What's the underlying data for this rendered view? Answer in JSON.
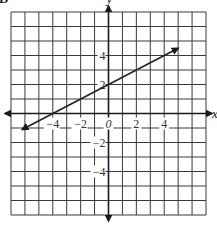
{
  "figure": {
    "corner_label": "B",
    "x_axis_letter": "x",
    "y_axis_letter": "y"
  },
  "chart_data": {
    "type": "line",
    "title": "",
    "xlabel": "x",
    "ylabel": "y",
    "xlim": [
      -7,
      7
    ],
    "ylim": [
      -7,
      7
    ],
    "grid": true,
    "grid_step": 1,
    "x_tick_labels": [
      {
        "value": -4,
        "label": "−4"
      },
      {
        "value": -2,
        "label": "−2"
      },
      {
        "value": 0,
        "label": "0"
      },
      {
        "value": 2,
        "label": "2"
      },
      {
        "value": 4,
        "label": "4"
      }
    ],
    "y_tick_labels": [
      {
        "value": 4,
        "label": "4"
      },
      {
        "value": 2,
        "label": "2"
      },
      {
        "value": -2,
        "label": "−2"
      },
      {
        "value": -4,
        "label": "−4"
      }
    ],
    "series": [
      {
        "name": "line",
        "equation": "y = 0.5x + 2",
        "slope": 0.5,
        "y_intercept": 2,
        "x_intercept": -4,
        "x": [
          -6.2,
          -4,
          0,
          2,
          5
        ],
        "y": [
          -1.1,
          0,
          2,
          3,
          4.5
        ],
        "arrows_both_ends": true
      }
    ]
  }
}
